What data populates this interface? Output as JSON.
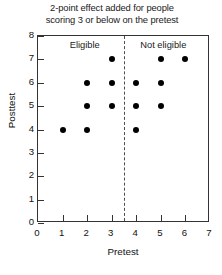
{
  "chart_data": {
    "type": "scatter",
    "title": "2-point effect added for people scoring 3 or below on the pretest",
    "title_lines": [
      "2-point effect added for people",
      "scoring 3 or below on the pretest"
    ],
    "xlabel": "Pretest",
    "ylabel": "Posttest",
    "xlim": [
      0,
      7
    ],
    "ylim": [
      0,
      8
    ],
    "xticks": [
      0,
      1,
      2,
      3,
      4,
      5,
      6,
      7
    ],
    "yticks": [
      0,
      1,
      2,
      3,
      4,
      5,
      6,
      7,
      8
    ],
    "grid": false,
    "legend": "none",
    "point_color": "#000000",
    "cutoff": {
      "x": 3.5,
      "style": "dashed",
      "color": "#4d4d4d"
    },
    "annotations": [
      {
        "text": "Eligible",
        "x": 1.9,
        "y": 7.62
      },
      {
        "text": "Not eligible",
        "x": 5.1,
        "y": 7.62
      }
    ],
    "points": [
      {
        "x": 3,
        "y": 7
      },
      {
        "x": 5,
        "y": 7
      },
      {
        "x": 6,
        "y": 7
      },
      {
        "x": 2,
        "y": 6
      },
      {
        "x": 3,
        "y": 6
      },
      {
        "x": 4,
        "y": 6
      },
      {
        "x": 5,
        "y": 6
      },
      {
        "x": 2,
        "y": 5
      },
      {
        "x": 3,
        "y": 5
      },
      {
        "x": 4,
        "y": 5
      },
      {
        "x": 5,
        "y": 5
      },
      {
        "x": 1,
        "y": 4
      },
      {
        "x": 2,
        "y": 4
      },
      {
        "x": 4,
        "y": 4
      }
    ]
  }
}
